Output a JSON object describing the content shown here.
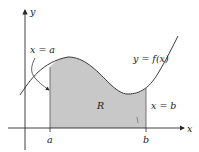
{
  "diagram": {
    "axes": {
      "x_label": "x",
      "y_label": "y"
    },
    "curve_label": "y = f(x)",
    "region_label": "R",
    "left_bound_label": "x = a",
    "right_bound_label": "x = b",
    "tick_a": "a",
    "tick_b": "b",
    "colors": {
      "region_fill": "#c8c8c8",
      "stroke": "#3a3a3a",
      "background": "#ffffff"
    }
  }
}
